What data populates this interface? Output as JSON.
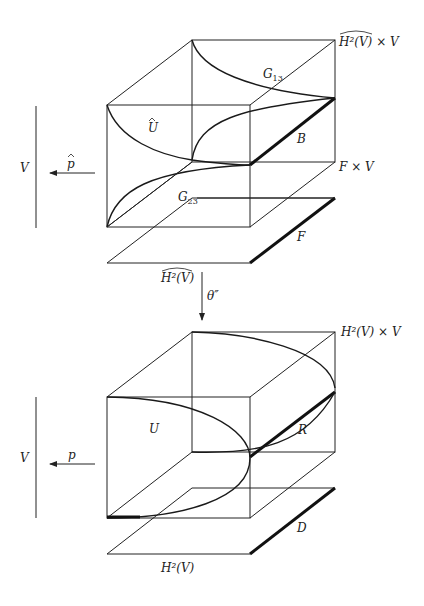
{
  "diagram": {
    "type": "commutative-geometric-diagram",
    "top_figure": {
      "total_space_label": "H²(V)^ × V",
      "total_space_hat_text": "H²(V)",
      "total_space_suffix": " × V",
      "subspace_label": "F × V",
      "region_label": "Û",
      "region_base": "U",
      "curve_label_1": "G",
      "curve_label_1_sub": "13",
      "curve_label_2": "G",
      "curve_label_2_sub": "23",
      "edge_label": "B",
      "base_plane_label": "F",
      "base_label_hat_text": "H²(V)",
      "projection_target": "V",
      "projection_map": "p̂"
    },
    "connecting_map": {
      "label": "θ″"
    },
    "bottom_figure": {
      "total_space_label": "H²(V) × V",
      "region_label": "U",
      "curve_label": "R",
      "base_plane_label": "D",
      "base_label": "H²(V)",
      "projection_target": "V",
      "projection_map": "p"
    }
  }
}
